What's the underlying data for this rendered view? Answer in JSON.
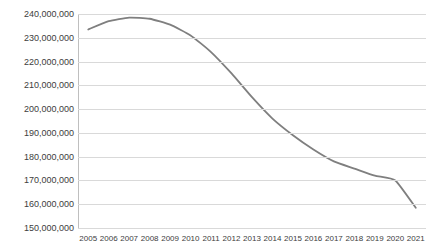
{
  "chart_data": {
    "type": "line",
    "title": "",
    "xlabel": "",
    "ylabel": "",
    "categories": [
      "2005",
      "2006",
      "2007",
      "2008",
      "2009",
      "2010",
      "2011",
      "2012",
      "2013",
      "2014",
      "2015",
      "2016",
      "2017",
      "2018",
      "2019",
      "2020",
      "2021"
    ],
    "series": [
      {
        "name": "",
        "color": "#7f7f7f",
        "values": [
          233500000,
          237000000,
          238500000,
          238000000,
          235500000,
          231000000,
          224000000,
          215000000,
          205000000,
          196000000,
          189000000,
          183000000,
          178000000,
          175000000,
          172000000,
          170000000,
          158500000
        ]
      }
    ],
    "ylim": [
      150000000,
      240000000
    ],
    "ytick_values": [
      150000000,
      160000000,
      170000000,
      180000000,
      190000000,
      200000000,
      210000000,
      220000000,
      230000000,
      240000000
    ],
    "ytick_labels": [
      "150,000,000",
      "160,000,000",
      "170,000,000",
      "180,000,000",
      "190,000,000",
      "200,000,000",
      "210,000,000",
      "220,000,000",
      "230,000,000",
      "240,000,000"
    ],
    "grid": true,
    "grid_color": "#d9d9d9",
    "axis_color": "#bfbfbf",
    "legend": false,
    "legend_position": "none",
    "markers": false,
    "background": "#ffffff",
    "text_color": "#3d3d3d"
  }
}
